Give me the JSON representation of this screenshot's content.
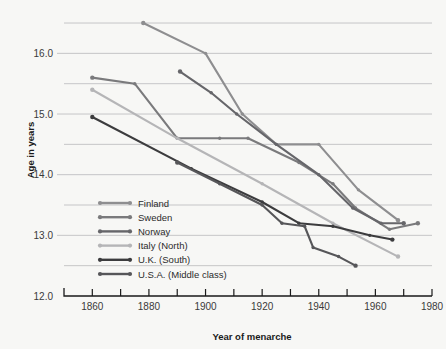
{
  "chart_data": {
    "type": "line",
    "title": "",
    "xlabel": "Year of menarche",
    "ylabel": "Age in years",
    "xlim": [
      1850,
      1980
    ],
    "ylim": [
      12.0,
      16.55
    ],
    "grid": true,
    "legend_position": "inside-lower-left",
    "x_tick_step": 10,
    "x_labeled_ticks": [
      1860,
      1880,
      1900,
      1920,
      1940,
      1960,
      1980
    ],
    "y_labeled_ticks": [
      12.0,
      13.0,
      14.0,
      15.0,
      16.0
    ],
    "y_gridline_values": [
      12.5,
      13.0,
      13.5,
      14.0,
      14.5,
      15.0,
      15.5,
      16.0,
      16.5
    ],
    "x_tick_labels": [
      "1860",
      "1880",
      "1900",
      "1920",
      "1940",
      "1960",
      "1980"
    ],
    "y_tick_labels": [
      "12.0",
      "13.0",
      "14.0",
      "15.0",
      "16.0"
    ],
    "series": [
      {
        "name": "Finland",
        "color": "#8e8e90",
        "points": [
          [
            1878,
            16.5
          ],
          [
            1900,
            16.0
          ],
          [
            1913,
            15.0
          ],
          [
            1925,
            14.5
          ],
          [
            1940,
            14.5
          ],
          [
            1954,
            13.75
          ],
          [
            1968,
            13.25
          ]
        ]
      },
      {
        "name": "Sweden",
        "color": "#7a7a7c",
        "points": [
          [
            1860,
            15.6
          ],
          [
            1875,
            15.5
          ],
          [
            1890,
            14.6
          ],
          [
            1905,
            14.6
          ],
          [
            1915,
            14.6
          ],
          [
            1933,
            14.2
          ],
          [
            1945,
            13.85
          ],
          [
            1953,
            13.45
          ],
          [
            1965,
            13.1
          ],
          [
            1975,
            13.2
          ]
        ]
      },
      {
        "name": "Norway",
        "color": "#66666a",
        "points": [
          [
            1891,
            15.7
          ],
          [
            1902,
            15.35
          ],
          [
            1911,
            15.0
          ],
          [
            1925,
            14.5
          ],
          [
            1940,
            14.0
          ],
          [
            1952,
            13.45
          ],
          [
            1962,
            13.2
          ],
          [
            1970,
            13.2
          ]
        ]
      },
      {
        "name": "Italy (North)",
        "color": "#b5b5b7",
        "points": [
          [
            1860,
            15.4
          ],
          [
            1890,
            14.6
          ],
          [
            1920,
            13.85
          ],
          [
            1945,
            13.2
          ],
          [
            1968,
            12.65
          ]
        ]
      },
      {
        "name": "U.K. (South)",
        "color": "#3c3c3e",
        "points": [
          [
            1860,
            14.95
          ],
          [
            1895,
            14.1
          ],
          [
            1920,
            13.55
          ],
          [
            1933,
            13.2
          ],
          [
            1945,
            13.15
          ],
          [
            1958,
            13.0
          ],
          [
            1966,
            12.93
          ]
        ]
      },
      {
        "name": "U.S.A. (Middle class)",
        "color": "#565659",
        "points": [
          [
            1890,
            14.2
          ],
          [
            1905,
            13.85
          ],
          [
            1920,
            13.5
          ],
          [
            1927,
            13.2
          ],
          [
            1935,
            13.15
          ],
          [
            1938,
            12.8
          ],
          [
            1947,
            12.65
          ],
          [
            1953,
            12.5
          ]
        ]
      }
    ]
  },
  "legend": {
    "items": [
      {
        "label": "Finland",
        "color": "#8e8e90"
      },
      {
        "label": "Sweden",
        "color": "#7a7a7c"
      },
      {
        "label": "Norway",
        "color": "#66666a"
      },
      {
        "label": "Italy (North)",
        "color": "#b5b5b7"
      },
      {
        "label": "U.K. (South)",
        "color": "#3c3c3e"
      },
      {
        "label": "U.S.A. (Middle class)",
        "color": "#565659"
      }
    ]
  },
  "colors": {
    "background": "#f7f7f5",
    "grid": "#b9b9bb",
    "axis": "#1a1a1a",
    "text": "#2b2b2b"
  }
}
